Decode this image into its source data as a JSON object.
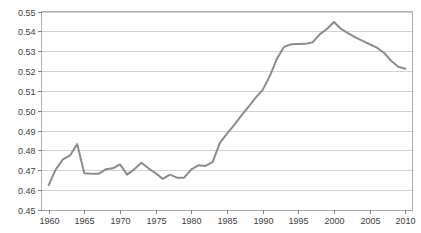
{
  "chart_data": {
    "type": "line",
    "title": "",
    "xlabel": "",
    "ylabel": "",
    "xlim": [
      1959,
      2011
    ],
    "ylim": [
      0.45,
      0.55
    ],
    "grid": true,
    "legend": "none",
    "line_color": "#8c8c8c",
    "gridline_color": "#bfbfbf",
    "axis_color": "#808080",
    "background_color": "#ffffff",
    "y_ticks": [
      "0.45",
      "0.46",
      "0.47",
      "0.48",
      "0.49",
      "0.50",
      "0.51",
      "0.52",
      "0.53",
      "0.54",
      "0.55"
    ],
    "y_tick_values": [
      0.45,
      0.46,
      0.47,
      0.48,
      0.49,
      0.5,
      0.51,
      0.52,
      0.53,
      0.54,
      0.55
    ],
    "x_ticks": [
      "1960",
      "1965",
      "1970",
      "1975",
      "1980",
      "1985",
      "1990",
      "1995",
      "2000",
      "2005",
      "2010"
    ],
    "x_tick_values": [
      1960,
      1965,
      1970,
      1975,
      1980,
      1985,
      1990,
      1995,
      2000,
      2005,
      2010
    ],
    "series": [
      {
        "name": "series-1",
        "color": "#8c8c8c",
        "x": [
          1960,
          1961,
          1962,
          1963,
          1964,
          1965,
          1966,
          1967,
          1968,
          1969,
          1970,
          1971,
          1972,
          1973,
          1974,
          1975,
          1976,
          1977,
          1978,
          1979,
          1980,
          1981,
          1982,
          1983,
          1984,
          1985,
          1986,
          1987,
          1988,
          1989,
          1990,
          1991,
          1992,
          1993,
          1994,
          1995,
          1996,
          1997,
          1998,
          1999,
          2000,
          2001,
          2002,
          2003,
          2004,
          2005,
          2006,
          2007,
          2008,
          2009,
          2010
        ],
        "values": [
          0.4625,
          0.4705,
          0.4755,
          0.4775,
          0.4832,
          0.4685,
          0.4683,
          0.4682,
          0.4705,
          0.471,
          0.473,
          0.4678,
          0.4705,
          0.4738,
          0.471,
          0.4685,
          0.4657,
          0.4678,
          0.4663,
          0.4663,
          0.4705,
          0.4725,
          0.4722,
          0.4742,
          0.4838,
          0.4885,
          0.4928,
          0.4975,
          0.502,
          0.5065,
          0.5105,
          0.5175,
          0.5262,
          0.5322,
          0.5335,
          0.5336,
          0.5337,
          0.5345,
          0.5385,
          0.5412,
          0.5447,
          0.5412,
          0.539,
          0.537,
          0.5352,
          0.5335,
          0.5318,
          0.5292,
          0.5252,
          0.5222,
          0.5212
        ]
      }
    ]
  },
  "axes": {
    "y_axis_name": "y-axis",
    "x_axis_name": "x-axis"
  }
}
